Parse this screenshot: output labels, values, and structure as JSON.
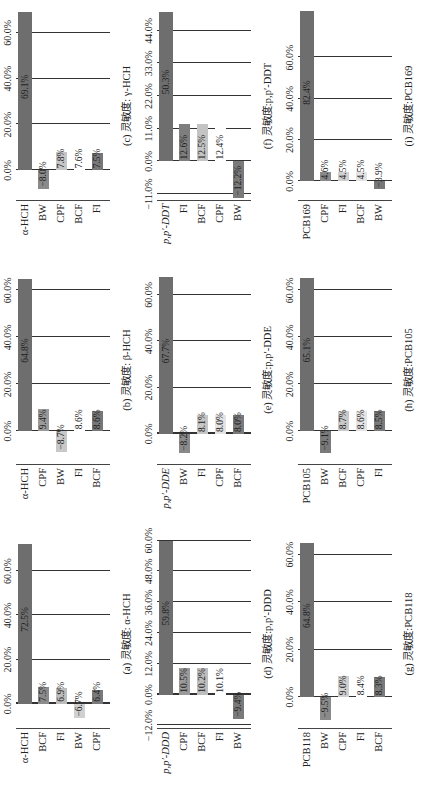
{
  "chart_data": [
    {
      "id": "a",
      "type": "bar",
      "orientation": "horizontal",
      "title": "(a) 灵敏度: α-HCH",
      "categories": [
        "α-HCH",
        "BCF",
        "FI",
        "BW",
        "CPF"
      ],
      "values": [
        72.5,
        7.5,
        6.9,
        -6.7,
        6.4
      ],
      "ticks": [
        "0.0%",
        "20.0%",
        "40.0%",
        "60.0%"
      ],
      "xlim": [
        -11,
        75
      ]
    },
    {
      "id": "b",
      "type": "bar",
      "orientation": "horizontal",
      "title": "(b) 灵敏度: β-HCH",
      "categories": [
        "α-HCH",
        "CPF",
        "BW",
        "FI",
        "BCF"
      ],
      "values": [
        64.8,
        9.4,
        -8.7,
        8.6,
        8.6
      ],
      "ticks": [
        "0.0%",
        "20.0%",
        "40.0%",
        "60.0%"
      ],
      "xlim": [
        -14,
        67
      ]
    },
    {
      "id": "c",
      "type": "bar",
      "orientation": "horizontal",
      "title": "(c) 灵敏度: γ-HCH",
      "categories": [
        "α-HCH",
        "BW",
        "CPF",
        "BCF",
        "FI"
      ],
      "values": [
        69.1,
        -8.0,
        7.8,
        7.6,
        7.5
      ],
      "ticks": [
        "0.0%",
        "20.0%",
        "40.0%",
        "60.0%"
      ],
      "xlim": [
        -13,
        70
      ]
    },
    {
      "id": "d",
      "type": "bar",
      "orientation": "horizontal",
      "title": "(d) 灵敏度:p,p′-DDD",
      "categories": [
        "p,p′-DDD",
        "CPF",
        "BCF",
        "FI",
        "BW"
      ],
      "values": [
        59.8,
        10.5,
        10.2,
        10.1,
        -9.4
      ],
      "ticks": [
        "−12.0%",
        "0.0%",
        "12.0%",
        "24.0%",
        "36.0%",
        "48.0%",
        "60.0%"
      ],
      "xlim": [
        -13,
        61
      ]
    },
    {
      "id": "e",
      "type": "bar",
      "orientation": "horizontal",
      "title": "(e) 灵敏度:p,p′-DDE",
      "categories": [
        "p,p′-DDE",
        "BW",
        "FI",
        "CPF",
        "BCF"
      ],
      "values": [
        67.7,
        -8.2,
        8.1,
        8.0,
        8.0
      ],
      "ticks": [
        "0.0%",
        "20.0%",
        "40.0%",
        "60.0%"
      ],
      "xlim": [
        -13,
        69
      ]
    },
    {
      "id": "f",
      "type": "bar",
      "orientation": "horizontal",
      "title": "(f) 灵敏度:p,p′-DDT",
      "categories": [
        "p,p′-DDT",
        "FI",
        "BCF",
        "CPF",
        "BW"
      ],
      "values": [
        50.3,
        12.6,
        12.5,
        12.4,
        -12.2
      ],
      "ticks": [
        "−11.0%",
        "0.0%",
        "11.0%",
        "22.0%",
        "33.0%",
        "44.0%"
      ],
      "xlim": [
        -13,
        51
      ]
    },
    {
      "id": "g",
      "type": "bar",
      "orientation": "horizontal",
      "title": "(g) 灵敏度:PCB118",
      "categories": [
        "PCB118",
        "BW",
        "CPF",
        "FI",
        "BCF"
      ],
      "values": [
        64.8,
        -9.5,
        9.0,
        8.4,
        8.3
      ],
      "ticks": [
        "0.0%",
        "20.0%",
        "40.0%",
        "60.0%"
      ],
      "xlim": [
        -13,
        67
      ]
    },
    {
      "id": "h",
      "type": "bar",
      "orientation": "horizontal",
      "title": "(h) 灵敏度:PCB105",
      "categories": [
        "PCB105",
        "BW",
        "BCF",
        "CPF",
        "FI"
      ],
      "values": [
        65.1,
        -9.1,
        8.7,
        8.6,
        8.5
      ],
      "ticks": [
        "0.0%",
        "20.0%",
        "40.0%",
        "60.0%"
      ],
      "xlim": [
        -14,
        67
      ]
    },
    {
      "id": "i",
      "type": "bar",
      "orientation": "horizontal",
      "title": "(i) 灵敏度:PCB169",
      "categories": [
        "PCB169",
        "CPF",
        "FI",
        "BCF",
        "BW"
      ],
      "values": [
        82.4,
        4.6,
        4.5,
        4.5,
        -3.9
      ],
      "ticks": [
        "0.0%",
        "20.0%",
        "40.0%",
        "60.0%"
      ],
      "xlim": [
        -9,
        83
      ]
    }
  ],
  "labels": {
    "a": {
      "title": "(a) 灵敏度: α-HCH",
      "cats": [
        "α-HCH",
        "BCF",
        "FI",
        "BW",
        "CPF"
      ],
      "vals": [
        "72.5%",
        "7.5%",
        "6.9%",
        "−6.7%",
        "6.4%"
      ]
    },
    "b": {
      "title": "(b) 灵敏度: β-HCH",
      "cats": [
        "α-HCH",
        "CPF",
        "BW",
        "FI",
        "BCF"
      ],
      "vals": [
        "64.8%",
        "9.4%",
        "−8.7%",
        "8.6%",
        "8.6%"
      ]
    },
    "c": {
      "title": "(c) 灵敏度: γ-HCH",
      "cats": [
        "α-HCH",
        "BW",
        "CPF",
        "BCF",
        "FI"
      ],
      "vals": [
        "69.1%",
        "−8.0%",
        "7.8%",
        "7.6%",
        "7.5%"
      ]
    },
    "d": {
      "title": "(d) 灵敏度:p,p′-DDD",
      "cats": [
        "p,p′-DDD",
        "CPF",
        "BCF",
        "FI",
        "BW"
      ],
      "vals": [
        "59.8%",
        "10.5%",
        "10.2%",
        "10.1%",
        "−9.4%"
      ]
    },
    "e": {
      "title": "(e) 灵敏度:p,p′-DDE",
      "cats": [
        "p,p′-DDE",
        "BW",
        "FI",
        "CPF",
        "BCF"
      ],
      "vals": [
        "67.7%",
        "−8.2%",
        "8.1%",
        "8.0%",
        "8.0%"
      ]
    },
    "f": {
      "title": "(f) 灵敏度:p,p′-DDT",
      "cats": [
        "p,p′-DDT",
        "FI",
        "BCF",
        "CPF",
        "BW"
      ],
      "vals": [
        "50.3%",
        "12.6%",
        "12.5%",
        "12.4%",
        "−12.2%"
      ]
    },
    "g": {
      "title": "(g) 灵敏度:PCB118",
      "cats": [
        "PCB118",
        "BW",
        "CPF",
        "FI",
        "BCF"
      ],
      "vals": [
        "64.8%",
        "−9.5%",
        "9.0%",
        "8.4%",
        "8.3%"
      ]
    },
    "h": {
      "title": "(h) 灵敏度:PCB105",
      "cats": [
        "PCB105",
        "BW",
        "BCF",
        "CPF",
        "FI"
      ],
      "vals": [
        "65.1%",
        "−9.1%",
        "8.7%",
        "8.6%",
        "8.5%"
      ]
    },
    "i": {
      "title": "(i) 灵敏度:PCB169",
      "cats": [
        "PCB169",
        "CPF",
        "FI",
        "BCF",
        "BW"
      ],
      "vals": [
        "82.4%",
        "4.6%",
        "4.5%",
        "4.5%",
        "−3.9%"
      ]
    }
  },
  "colors": {
    "main": "#6b6b6b",
    "BW": "#7a7a7a",
    "BCF": "#a8a8a8",
    "CPF": "#c4c4c4",
    "FI": "#8a8a8a",
    "light": "#d9d9d9"
  }
}
